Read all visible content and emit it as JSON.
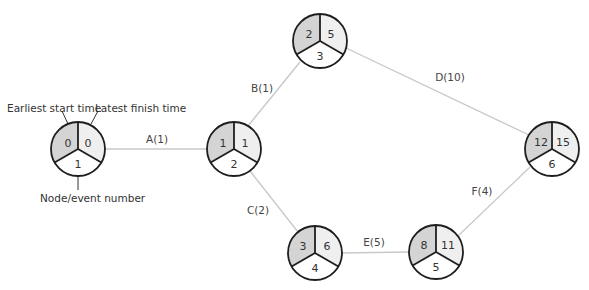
{
  "diagram": {
    "type": "activity-on-arrow network",
    "colors": {
      "earliest_start_fill": "#d4d4d4",
      "latest_finish_fill": "#efefef",
      "node_number_fill": "#ffffff",
      "edge": "#c8c8c8",
      "outline": "#1e1e1e"
    },
    "legend": {
      "earliest_start": "Earliest start time",
      "latest_finish": "Latest finish time",
      "node_number": "Node/event number"
    },
    "nodes": [
      {
        "id": 1,
        "earliest_start": "0",
        "latest_finish": "0",
        "number": "1"
      },
      {
        "id": 2,
        "earliest_start": "1",
        "latest_finish": "1",
        "number": "2"
      },
      {
        "id": 3,
        "earliest_start": "2",
        "latest_finish": "5",
        "number": "3"
      },
      {
        "id": 4,
        "earliest_start": "3",
        "latest_finish": "6",
        "number": "4"
      },
      {
        "id": 5,
        "earliest_start": "8",
        "latest_finish": "11",
        "number": "5"
      },
      {
        "id": 6,
        "earliest_start": "12",
        "latest_finish": "15",
        "number": "6"
      }
    ],
    "edges": [
      {
        "from": 1,
        "to": 2,
        "label": "A(1)"
      },
      {
        "from": 2,
        "to": 3,
        "label": "B(1)"
      },
      {
        "from": 2,
        "to": 4,
        "label": "C(2)"
      },
      {
        "from": 3,
        "to": 6,
        "label": "D(10)"
      },
      {
        "from": 4,
        "to": 5,
        "label": "E(5)"
      },
      {
        "from": 5,
        "to": 6,
        "label": "F(4)"
      }
    ]
  }
}
